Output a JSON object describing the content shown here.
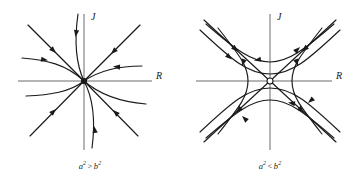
{
  "figure": {
    "background_color": "#ffffff",
    "curve_color": "#1a1a1a",
    "axis_color": "#9d9d9d",
    "panels": [
      {
        "id": "left",
        "type": "stable-node",
        "axis_labels": {
          "x": "R",
          "y": "J"
        },
        "origin_marker": "filled-dot",
        "caption": {
          "base_a": "a",
          "exp_a": "2",
          "relation": ">",
          "base_b": "b",
          "exp_b": "2",
          "full_text": "a2 > b2"
        }
      },
      {
        "id": "right",
        "type": "saddle-point",
        "axis_labels": {
          "x": "R",
          "y": "J"
        },
        "origin_marker": "open-circle",
        "caption": {
          "base_a": "a",
          "exp_a": "2",
          "relation": "<",
          "base_b": "b",
          "exp_b": "2",
          "full_text": "a2 < b2"
        }
      }
    ]
  }
}
